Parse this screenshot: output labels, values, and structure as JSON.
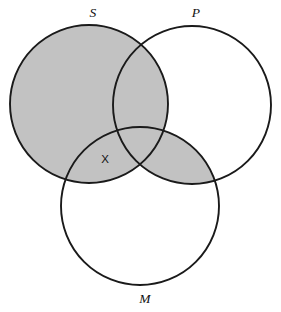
{
  "diagram": {
    "type": "venn-diagram",
    "kind": "three-circle-syllogism-venn",
    "background_color": "#ffffff",
    "outline_color": "#1a1a1a",
    "shade_color": "#c2c2c2",
    "circles": [
      {
        "id": "S",
        "label": "S",
        "cx": 89,
        "cy": 104,
        "r": 79
      },
      {
        "id": "P",
        "label": "P",
        "cx": 192,
        "cy": 105,
        "r": 79
      },
      {
        "id": "M",
        "label": "M",
        "cx": 140,
        "cy": 206,
        "r": 79
      }
    ],
    "labels": {
      "s": "S",
      "p": "P",
      "m": "M",
      "x": "X"
    },
    "label_positions": {
      "s": {
        "x": 93,
        "y": 14
      },
      "p": {
        "x": 196,
        "y": 14
      },
      "m": {
        "x": 145,
        "y": 300
      },
      "x": {
        "x": 105,
        "y": 160
      }
    },
    "shaded_regions": [
      {
        "id": "S-whole",
        "description": "entire S circle"
      },
      {
        "id": "P-and-M",
        "description": "intersection of P and M"
      }
    ],
    "marked_regions": [
      {
        "id": "S-and-M-not-P",
        "mark": "X",
        "description": "S intersect M, outside P"
      }
    ]
  }
}
